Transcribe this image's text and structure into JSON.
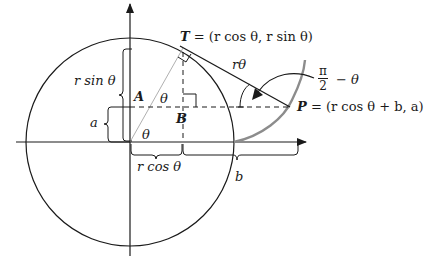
{
  "figure": {
    "points": {
      "T": {
        "label": "T",
        "coords": "= (r cos θ, r sin θ)"
      },
      "P": {
        "label": "P",
        "coords": "= (r cos θ + b, a)"
      },
      "A": {
        "label": "A"
      },
      "B": {
        "label": "B"
      }
    },
    "labels": {
      "r_sin_theta": "r sin θ",
      "r_cos_theta": "r cos θ",
      "a": "a",
      "b": "b",
      "r_theta": "rθ",
      "theta_origin": "θ",
      "theta_A": "θ",
      "angle_num": "π",
      "angle_den": "2",
      "angle_rest": "− θ"
    },
    "colors": {
      "ink": "#1a1a1a",
      "involute": "#8c8c8c",
      "radius_line": "#b0b0b0"
    }
  }
}
